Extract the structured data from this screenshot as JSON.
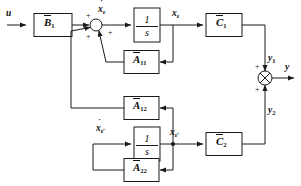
{
  "diagram": {
    "line_color": "#1a1a1a",
    "text_color": "#101010",
    "background": "#ffffff"
  },
  "blocks": {
    "b1": {
      "name": "B-bar-1",
      "base": "B",
      "sub": "1",
      "overbar": true
    },
    "integrator_1": {
      "name": "integrator-upper",
      "numerator": "1",
      "denominator": "s"
    },
    "a11": {
      "name": "A-bar-11",
      "base": "A",
      "sub": "11",
      "overbar": true
    },
    "a12": {
      "name": "A-bar-12",
      "base": "A",
      "sub": "12",
      "overbar": true
    },
    "a22": {
      "name": "A-bar-22",
      "base": "A",
      "sub": "22",
      "overbar": true
    },
    "integrator_2": {
      "name": "integrator-lower",
      "numerator": "1",
      "denominator": "s"
    },
    "c1": {
      "name": "C-bar-1",
      "base": "C",
      "sub": "1",
      "overbar": true
    },
    "c2": {
      "name": "C-bar-2",
      "base": "C",
      "sub": "2",
      "overbar": true
    }
  },
  "signals": {
    "input": {
      "base": "u",
      "sub": ""
    },
    "xdot_upper": {
      "base": "x",
      "sub": "ε",
      "dot": true
    },
    "x_upper": {
      "base": "x",
      "sub": "ε",
      "dot": false
    },
    "xdot_lower": {
      "base": "x",
      "sub": "ε̄",
      "dot": true
    },
    "x_lower": {
      "base": "x",
      "sub": "ε̄",
      "dot": false
    },
    "y1": {
      "base": "y",
      "sub": "1"
    },
    "y2": {
      "base": "y",
      "sub": "2"
    },
    "output": {
      "base": "y",
      "sub": ""
    }
  },
  "summing_junctions": {
    "input_sum": {
      "name": "input-summing-junction",
      "style": "open-circle",
      "signs": [
        "+",
        "+",
        "+"
      ],
      "sign_top": "+",
      "sign_left": "+",
      "sign_right": "+"
    },
    "output_sum": {
      "name": "output-summing-junction",
      "style": "crossed-circle",
      "signs": [
        "+",
        "+"
      ],
      "sign_top": "+",
      "sign_bottom": "+"
    }
  }
}
